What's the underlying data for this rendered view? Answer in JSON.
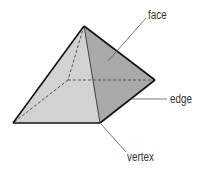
{
  "diagram": {
    "type": "labeled-geometry",
    "colors": {
      "left_face": "#d2d2d2",
      "right_face": "#a9a9a9",
      "outline": "#111111",
      "hidden_edge": "#555555",
      "leader": "#555555",
      "label_text": "#333333"
    },
    "vertices": {
      "apex": [
        84,
        26
      ],
      "left": [
        13,
        123
      ],
      "front_right": [
        100,
        123
      ],
      "right": [
        155,
        80
      ],
      "hidden_back": [
        68,
        80
      ]
    },
    "labels": [
      {
        "id": "face",
        "text": "face",
        "points_to": "right lateral face"
      },
      {
        "id": "edge",
        "text": "edge",
        "points_to": "edge between front-right and right vertices"
      },
      {
        "id": "vertex",
        "text": "vertex",
        "points_to": "front-right vertex"
      }
    ]
  }
}
